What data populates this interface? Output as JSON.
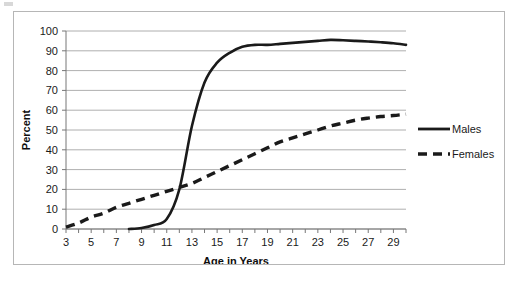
{
  "chart_data": {
    "type": "line",
    "title": "",
    "xlabel": "Age in Years",
    "ylabel": "Percent",
    "xlim": [
      3,
      30
    ],
    "ylim": [
      0,
      100
    ],
    "grid": true,
    "legend_position": "right",
    "x_tick_labels": [
      "3",
      "5",
      "7",
      "9",
      "11",
      "13",
      "15",
      "17",
      "19",
      "21",
      "23",
      "25",
      "27",
      "29"
    ],
    "x_tick_values": [
      3,
      5,
      7,
      9,
      11,
      13,
      15,
      17,
      19,
      21,
      23,
      25,
      27,
      29
    ],
    "y_tick_labels": [
      "0",
      "10",
      "20",
      "30",
      "40",
      "50",
      "60",
      "70",
      "80",
      "90",
      "100"
    ],
    "y_tick_values": [
      0,
      10,
      20,
      30,
      40,
      50,
      60,
      70,
      80,
      90,
      100
    ],
    "x": [
      3,
      4,
      5,
      6,
      7,
      8,
      9,
      10,
      11,
      12,
      13,
      14,
      15,
      16,
      17,
      18,
      19,
      20,
      21,
      22,
      23,
      24,
      25,
      26,
      27,
      28,
      29,
      30
    ],
    "series": [
      {
        "name": "Males",
        "style": "solid",
        "color": "#1a1a1a",
        "values": [
          null,
          null,
          null,
          null,
          null,
          0,
          0.5,
          2,
          5,
          20,
          52,
          74,
          84,
          89,
          92,
          93,
          93,
          93.5,
          94,
          94.5,
          95,
          95.5,
          95.3,
          95,
          94.7,
          94.3,
          93.8,
          93
        ]
      },
      {
        "name": "Females",
        "style": "dashed",
        "color": "#1a1a1a",
        "values": [
          1,
          3,
          6,
          8,
          11,
          13,
          15,
          17,
          19,
          21,
          23,
          26,
          29,
          32,
          35,
          38,
          41,
          44,
          46,
          48,
          50,
          52,
          53.5,
          55,
          56,
          56.8,
          57.3,
          58
        ]
      }
    ]
  },
  "legend": {
    "items": [
      {
        "label": "Males",
        "style": "solid"
      },
      {
        "label": "Females",
        "style": "dashed"
      }
    ]
  }
}
